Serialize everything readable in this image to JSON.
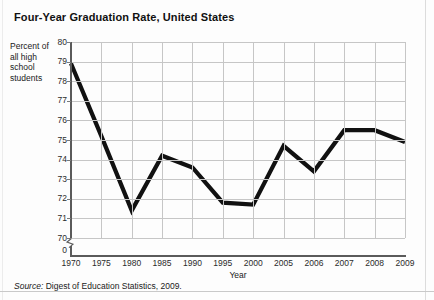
{
  "chart_data": {
    "type": "line",
    "title": "Four-Year Graduation Rate, United States",
    "xlabel": "Year",
    "ylabel": "Percent of all high school students",
    "categories": [
      "1970",
      "1975",
      "1980",
      "1985",
      "1990",
      "1995",
      "2000",
      "2005",
      "2006",
      "2007",
      "2008",
      "2009"
    ],
    "values": [
      78.9,
      75.2,
      71.4,
      74.2,
      73.6,
      71.8,
      71.7,
      74.7,
      73.4,
      75.5,
      75.5,
      74.9
    ],
    "series": [
      {
        "name": "Four-year graduation rate",
        "values": [
          78.9,
          75.2,
          71.4,
          74.2,
          73.6,
          71.8,
          71.7,
          74.7,
          73.4,
          75.5,
          75.5,
          74.9
        ]
      }
    ],
    "ylim": [
      70,
      80
    ],
    "yticks": [
      "80",
      "79",
      "78",
      "77",
      "76",
      "75",
      "74",
      "73",
      "72",
      "71",
      "70",
      "0"
    ],
    "ytick_values": [
      80,
      79,
      78,
      77,
      76,
      75,
      74,
      73,
      72,
      71,
      70,
      0
    ],
    "axis_break": true,
    "grid": true,
    "legend": "none",
    "line_color": "#111111",
    "grid_color": "#c6c6c6",
    "axis_color": "#5a5a5a"
  },
  "source": {
    "keyword": "Source:",
    "text": " Digest of Education Statistics, 2009."
  },
  "ylabel_lines": [
    "Percent of",
    "all high",
    "school",
    "students"
  ]
}
